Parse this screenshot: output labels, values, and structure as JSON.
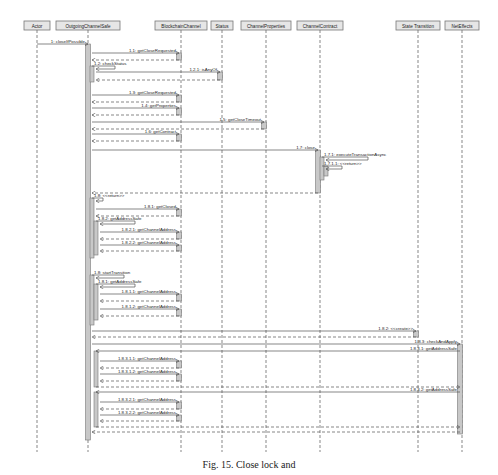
{
  "lifelines": [
    {
      "id": "actor",
      "label": "Actor",
      "x": 37,
      "w": 26
    },
    {
      "id": "ocs",
      "label": "OutgoingChannelSafe",
      "x": 88,
      "w": 64
    },
    {
      "id": "bc",
      "label": "BlockchainChannel",
      "x": 181,
      "w": 52
    },
    {
      "id": "status",
      "label": "Status",
      "x": 222,
      "w": 22
    },
    {
      "id": "props",
      "label": "ChannelProperties",
      "x": 266,
      "w": 50
    },
    {
      "id": "contract",
      "label": "ChannelContract",
      "x": 320,
      "w": 46
    },
    {
      "id": "st",
      "label": "State Transition",
      "x": 418,
      "w": 44
    },
    {
      "id": "ne",
      "label": "NetEffects",
      "x": 462,
      "w": 34
    }
  ],
  "messages": [
    {
      "label": "1: closeIfPossible",
      "from": 37,
      "to": 88,
      "y": 44,
      "type": "call"
    },
    {
      "label": "1.1: getCloseRequested",
      "from": 92,
      "to": 179,
      "y": 53,
      "type": "call"
    },
    {
      "label": "",
      "from": 179,
      "to": 92,
      "y": 60,
      "type": "return"
    },
    {
      "label": "1.2: checkStatus",
      "from": 92,
      "to": 115,
      "y": 66,
      "type": "self"
    },
    {
      "label": "1.2.1: isAnyOf",
      "from": 96,
      "to": 220,
      "y": 72,
      "type": "call"
    },
    {
      "label": "",
      "from": 220,
      "to": 96,
      "y": 80,
      "type": "return"
    },
    {
      "label": "1.3: getCloseRequested",
      "from": 92,
      "to": 179,
      "y": 95,
      "type": "call"
    },
    {
      "label": "",
      "from": 179,
      "to": 92,
      "y": 102,
      "type": "return"
    },
    {
      "label": "1.4: getProperties",
      "from": 92,
      "to": 179,
      "y": 108,
      "type": "call"
    },
    {
      "label": "",
      "from": 179,
      "to": 92,
      "y": 115,
      "type": "return"
    },
    {
      "label": "1.5: getCloseTimeout",
      "from": 92,
      "to": 264,
      "y": 122,
      "type": "call"
    },
    {
      "label": "",
      "from": 264,
      "to": 92,
      "y": 129,
      "type": "return"
    },
    {
      "label": "1.6: getContract",
      "from": 92,
      "to": 179,
      "y": 134,
      "type": "call"
    },
    {
      "label": "",
      "from": 179,
      "to": 92,
      "y": 141,
      "type": "return"
    },
    {
      "label": "1.7: close",
      "from": 92,
      "to": 318,
      "y": 150,
      "type": "call"
    },
    {
      "label": "1.7.1: executeTransactionAsync",
      "from": 322,
      "to": 368,
      "y": 157,
      "type": "self"
    },
    {
      "label": "1.7.1.1: <<return>>",
      "from": 322,
      "to": 342,
      "y": 166,
      "type": "self"
    },
    {
      "label": "",
      "from": 318,
      "to": 92,
      "y": 193,
      "type": "return"
    },
    {
      "label": "1.8: <<return>>",
      "from": 92,
      "to": 103,
      "y": 198,
      "type": "self"
    },
    {
      "label": "1.8.1: getClosed",
      "from": 96,
      "to": 179,
      "y": 209,
      "type": "call"
    },
    {
      "label": "",
      "from": 179,
      "to": 96,
      "y": 216,
      "type": "return"
    },
    {
      "label": "1.8.2: getAddressSafe",
      "from": 96,
      "to": 135,
      "y": 221,
      "type": "self"
    },
    {
      "label": "1.8.2.1: getChannelAddress",
      "from": 100,
      "to": 179,
      "y": 232,
      "type": "call"
    },
    {
      "label": "",
      "from": 179,
      "to": 100,
      "y": 239,
      "type": "return"
    },
    {
      "label": "1.8.2.2: getChannelAddress",
      "from": 100,
      "to": 179,
      "y": 245,
      "type": "call"
    },
    {
      "label": "",
      "from": 179,
      "to": 100,
      "y": 251,
      "type": "return"
    },
    {
      "label": "1.8: startTransition",
      "from": 92,
      "to": 124,
      "y": 275,
      "type": "self"
    },
    {
      "label": "1.8.1: getAddressSafe",
      "from": 96,
      "to": 135,
      "y": 284,
      "type": "self"
    },
    {
      "label": "1.8.1.1: getChannelAddress",
      "from": 100,
      "to": 179,
      "y": 294,
      "type": "call"
    },
    {
      "label": "",
      "from": 179,
      "to": 100,
      "y": 301,
      "type": "return"
    },
    {
      "label": "1.8.1.2: getChannelAddress",
      "from": 100,
      "to": 179,
      "y": 309,
      "type": "call"
    },
    {
      "label": "",
      "from": 179,
      "to": 100,
      "y": 316,
      "type": "return"
    },
    {
      "label": "1.8.2: <<create>>",
      "from": 92,
      "to": 416,
      "y": 331,
      "type": "call"
    },
    {
      "label": "",
      "from": 416,
      "to": 92,
      "y": 337,
      "type": "return"
    },
    {
      "label": "1.8.3: checkAndApply",
      "from": 92,
      "to": 460,
      "y": 344,
      "type": "call"
    },
    {
      "label": "1.8.3.1: getAddressSafe",
      "from": 460,
      "to": 96,
      "y": 351,
      "type": "call"
    },
    {
      "label": "1.8.3.1.1: getChannelAddress",
      "from": 100,
      "to": 179,
      "y": 361,
      "type": "call"
    },
    {
      "label": "",
      "from": 179,
      "to": 100,
      "y": 368,
      "type": "return"
    },
    {
      "label": "1.8.3.1.2: getChannelAddress",
      "from": 100,
      "to": 179,
      "y": 374,
      "type": "call"
    },
    {
      "label": "",
      "from": 179,
      "to": 100,
      "y": 381,
      "type": "return"
    },
    {
      "label": "",
      "from": 96,
      "to": 460,
      "y": 387,
      "type": "return"
    },
    {
      "label": "1.8.3.2: getAddressSafe",
      "from": 460,
      "to": 96,
      "y": 392,
      "type": "call"
    },
    {
      "label": "1.8.3.2.1: getChannelAddress",
      "from": 100,
      "to": 179,
      "y": 402,
      "type": "call"
    },
    {
      "label": "",
      "from": 179,
      "to": 100,
      "y": 409,
      "type": "return"
    },
    {
      "label": "1.8.3.2.2: getChannelAddress",
      "from": 100,
      "to": 179,
      "y": 415,
      "type": "call"
    },
    {
      "label": "",
      "from": 179,
      "to": 100,
      "y": 421,
      "type": "return"
    },
    {
      "label": "",
      "from": 96,
      "to": 460,
      "y": 427,
      "type": "return"
    },
    {
      "label": "",
      "from": 460,
      "to": 92,
      "y": 432,
      "type": "return"
    }
  ],
  "activations": [
    {
      "x": 88,
      "y1": 44,
      "y2": 440,
      "w": 5
    },
    {
      "x": 92,
      "y1": 66,
      "y2": 82,
      "w": 4
    },
    {
      "x": 179,
      "y1": 53,
      "y2": 60,
      "w": 5
    },
    {
      "x": 220,
      "y1": 72,
      "y2": 80,
      "w": 5
    },
    {
      "x": 179,
      "y1": 95,
      "y2": 102,
      "w": 5
    },
    {
      "x": 179,
      "y1": 108,
      "y2": 115,
      "w": 5
    },
    {
      "x": 264,
      "y1": 122,
      "y2": 129,
      "w": 5
    },
    {
      "x": 179,
      "y1": 134,
      "y2": 141,
      "w": 5
    },
    {
      "x": 318,
      "y1": 150,
      "y2": 193,
      "w": 5
    },
    {
      "x": 322,
      "y1": 157,
      "y2": 180,
      "w": 4
    },
    {
      "x": 326,
      "y1": 166,
      "y2": 176,
      "w": 4
    },
    {
      "x": 92,
      "y1": 198,
      "y2": 258,
      "w": 4
    },
    {
      "x": 96,
      "y1": 221,
      "y2": 255,
      "w": 4
    },
    {
      "x": 179,
      "y1": 209,
      "y2": 216,
      "w": 5
    },
    {
      "x": 179,
      "y1": 232,
      "y2": 239,
      "w": 5
    },
    {
      "x": 179,
      "y1": 245,
      "y2": 251,
      "w": 5
    },
    {
      "x": 92,
      "y1": 275,
      "y2": 325,
      "w": 4
    },
    {
      "x": 96,
      "y1": 284,
      "y2": 320,
      "w": 4
    },
    {
      "x": 179,
      "y1": 294,
      "y2": 301,
      "w": 5
    },
    {
      "x": 179,
      "y1": 309,
      "y2": 316,
      "w": 5
    },
    {
      "x": 416,
      "y1": 331,
      "y2": 337,
      "w": 5
    },
    {
      "x": 460,
      "y1": 344,
      "y2": 434,
      "w": 5
    },
    {
      "x": 96,
      "y1": 351,
      "y2": 387,
      "w": 4
    },
    {
      "x": 179,
      "y1": 361,
      "y2": 368,
      "w": 5
    },
    {
      "x": 179,
      "y1": 374,
      "y2": 381,
      "w": 5
    },
    {
      "x": 96,
      "y1": 392,
      "y2": 427,
      "w": 4
    },
    {
      "x": 179,
      "y1": 402,
      "y2": 409,
      "w": 5
    },
    {
      "x": 179,
      "y1": 415,
      "y2": 421,
      "w": 5
    }
  ],
  "caption": "Fig. 15. Close lock and",
  "colors": {
    "line": "#555555",
    "box_fill": "#e6e6e6",
    "box_stroke": "#777777",
    "activation_fill": "#c8c8c8",
    "text": "#222222"
  }
}
